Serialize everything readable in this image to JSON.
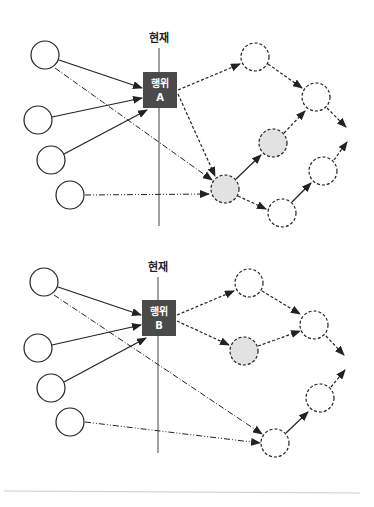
{
  "diagrams": [
    {
      "id": "A",
      "now_label": "현재",
      "action_label_line1": "행위",
      "action_label_line2": "A"
    },
    {
      "id": "B",
      "now_label": "현재",
      "action_label_line1": "행위",
      "action_label_line2": "B"
    }
  ],
  "colors": {
    "line": "#222222",
    "box_fill": "#4a4a4a",
    "highlight_fill": "#e2e2e2",
    "divider": "#cccccc"
  }
}
